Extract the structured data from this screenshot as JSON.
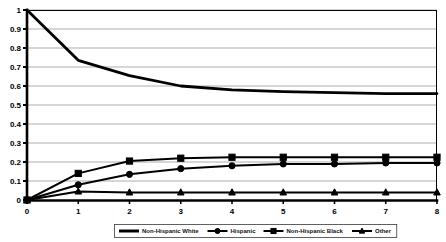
{
  "chart_data": {
    "type": "line",
    "title": "",
    "subtitle": "",
    "xlabel": "",
    "ylabel": "",
    "x": [
      0,
      1,
      2,
      3,
      4,
      5,
      6,
      7,
      8
    ],
    "xlim": [
      0,
      8
    ],
    "ylim": [
      0,
      1
    ],
    "x_ticks": [
      "0",
      "1",
      "2",
      "3",
      "4",
      "5",
      "6",
      "7",
      "8"
    ],
    "y_ticks": [
      "0",
      "0.1",
      "0.2",
      "0.3",
      "0.4",
      "0.5",
      "0.6",
      "0.7",
      "0.8",
      "0.9",
      "1"
    ],
    "y_tick_values": [
      0,
      0.1,
      0.2,
      0.3,
      0.4,
      0.5,
      0.6,
      0.7,
      0.8,
      0.9,
      1
    ],
    "grid": "horizontal",
    "legend_position": "bottom",
    "series": [
      {
        "name": "Non-Hispanic White",
        "marker": "none",
        "color": "#000000",
        "line_width": 2.8,
        "values": [
          1.0,
          0.735,
          0.655,
          0.6,
          0.58,
          0.57,
          0.565,
          0.56,
          0.56
        ]
      },
      {
        "name": "Hispanic",
        "marker": "circle",
        "color": "#000000",
        "line_width": 2.0,
        "values": [
          0.0,
          0.08,
          0.135,
          0.165,
          0.18,
          0.19,
          0.19,
          0.195,
          0.195
        ]
      },
      {
        "name": "Non-Hispanic Black",
        "marker": "square",
        "color": "#000000",
        "line_width": 2.0,
        "values": [
          0.0,
          0.14,
          0.205,
          0.22,
          0.225,
          0.225,
          0.225,
          0.225,
          0.225
        ]
      },
      {
        "name": "Other",
        "marker": "triangle",
        "color": "#000000",
        "line_width": 2.0,
        "values": [
          0.0,
          0.045,
          0.04,
          0.04,
          0.04,
          0.04,
          0.04,
          0.04,
          0.04
        ]
      }
    ]
  },
  "legend": {
    "entries": [
      {
        "label": "Non-Hispanic White",
        "marker": "none"
      },
      {
        "label": "Hispanic",
        "marker": "circle"
      },
      {
        "label": "Non-Hispanic Black",
        "marker": "square"
      },
      {
        "label": "Other",
        "marker": "triangle"
      }
    ]
  },
  "colors": {
    "background": "#ffffff",
    "line": "#000000",
    "gridline": "#8a8a8a",
    "axis": "#000000",
    "legend_border": "#3a3a3a"
  }
}
